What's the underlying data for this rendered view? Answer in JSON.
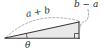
{
  "figure": {
    "name": "right-triangle-geometry-diagram",
    "background_color": "#ffffff",
    "stroke_color": "#3a3a3a",
    "fill_color": "#e8e8e8",
    "dash_color": "#9a9a9a",
    "labels": {
      "hypotenuse": "a + b",
      "vertical_leg": "b − a",
      "angle": "θ"
    },
    "geometry": {
      "vertex_left": [
        5,
        38
      ],
      "vertex_bottom_right": [
        79,
        38
      ],
      "vertex_top_right": [
        79,
        22
      ],
      "right_angle_marker_at": [
        79,
        38
      ],
      "angle_marker_at": [
        5,
        38
      ],
      "arc_above_hypotenuse": true,
      "leader_line_to_vertical_leg": true
    }
  }
}
